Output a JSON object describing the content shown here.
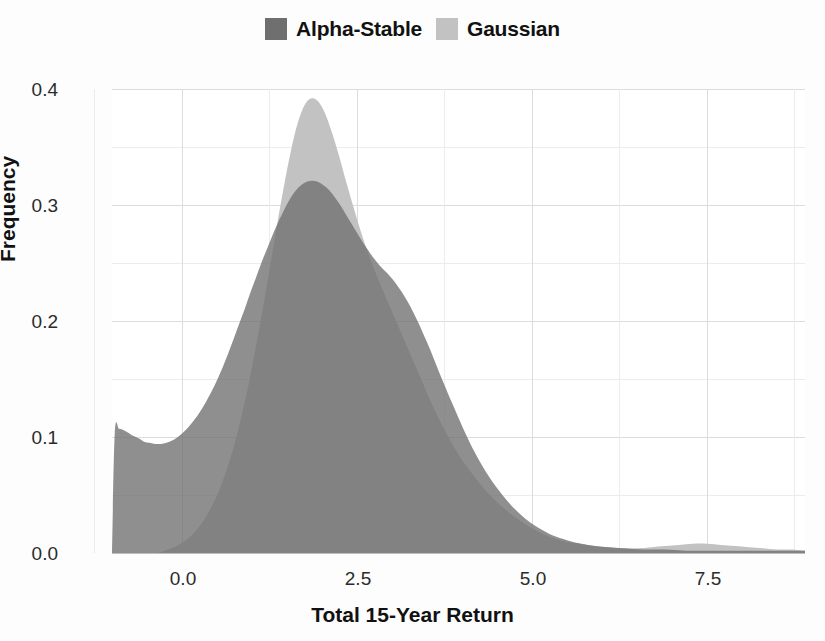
{
  "chart_data": {
    "type": "area",
    "title": "",
    "xlabel": "Total 15-Year Return",
    "ylabel": "Frequency",
    "xlim": [
      -1.0,
      8.9
    ],
    "ylim": [
      0.0,
      0.4
    ],
    "xticks": [
      "0.0",
      "2.5",
      "5.0",
      "7.5"
    ],
    "xtick_values": [
      0.0,
      2.5,
      5.0,
      7.5
    ],
    "yticks": [
      "0.0",
      "0.1",
      "0.2",
      "0.3",
      "0.4"
    ],
    "ytick_values": [
      0.0,
      0.1,
      0.2,
      0.3,
      0.4
    ],
    "grid": true,
    "grid_minor_x": [
      -1.25,
      1.25,
      3.75,
      6.25,
      8.75
    ],
    "grid_minor_y": [
      0.05,
      0.15,
      0.25,
      0.35
    ],
    "legend_position": "top-center",
    "colors": {
      "alpha_stable": "#6f6f6f",
      "gaussian": "#c2c2c2",
      "grid": "#dcdcdc",
      "axis_text": "#2b2b2b",
      "background": "#ffffff"
    },
    "series": [
      {
        "name": "Alpha-Stable",
        "color": "#6f6f6f",
        "x": [
          -1.0,
          -0.96,
          -0.9,
          -0.84,
          -0.78,
          -0.7,
          -0.62,
          -0.54,
          -0.46,
          -0.38,
          -0.3,
          -0.22,
          -0.14,
          -0.06,
          0.02,
          0.1,
          0.18,
          0.26,
          0.34,
          0.42,
          0.5,
          0.58,
          0.66,
          0.74,
          0.82,
          0.9,
          0.98,
          1.06,
          1.14,
          1.22,
          1.3,
          1.38,
          1.46,
          1.54,
          1.62,
          1.7,
          1.78,
          1.86,
          1.94,
          2.02,
          2.1,
          2.18,
          2.26,
          2.34,
          2.42,
          2.5,
          2.58,
          2.66,
          2.74,
          2.82,
          2.9,
          2.98,
          3.06,
          3.14,
          3.22,
          3.3,
          3.38,
          3.46,
          3.54,
          3.62,
          3.7,
          3.86,
          4.02,
          4.18,
          4.34,
          4.5,
          4.66,
          4.82,
          4.98,
          5.14,
          5.3,
          5.5,
          5.7,
          5.9,
          6.1,
          6.3,
          6.6,
          6.9,
          7.2,
          7.5,
          7.8,
          8.1,
          8.4,
          8.7,
          8.9
        ],
        "y": [
          0.0,
          0.104,
          0.107,
          0.106,
          0.104,
          0.101,
          0.099,
          0.096,
          0.095,
          0.094,
          0.094,
          0.095,
          0.097,
          0.1,
          0.104,
          0.109,
          0.115,
          0.122,
          0.13,
          0.139,
          0.149,
          0.16,
          0.172,
          0.185,
          0.198,
          0.211,
          0.225,
          0.238,
          0.251,
          0.263,
          0.275,
          0.286,
          0.296,
          0.305,
          0.312,
          0.317,
          0.32,
          0.321,
          0.32,
          0.317,
          0.313,
          0.307,
          0.3,
          0.292,
          0.284,
          0.276,
          0.268,
          0.261,
          0.254,
          0.248,
          0.243,
          0.238,
          0.232,
          0.225,
          0.217,
          0.208,
          0.198,
          0.187,
          0.176,
          0.164,
          0.152,
          0.129,
          0.107,
          0.087,
          0.07,
          0.056,
          0.044,
          0.034,
          0.026,
          0.02,
          0.015,
          0.011,
          0.008,
          0.006,
          0.005,
          0.004,
          0.003,
          0.003,
          0.002,
          0.002,
          0.002,
          0.002,
          0.002,
          0.002,
          0.002
        ]
      },
      {
        "name": "Gaussian",
        "color": "#c2c2c2",
        "x": [
          -0.35,
          -0.25,
          -0.15,
          -0.05,
          0.05,
          0.15,
          0.25,
          0.35,
          0.45,
          0.55,
          0.65,
          0.75,
          0.85,
          0.95,
          1.05,
          1.15,
          1.25,
          1.35,
          1.45,
          1.55,
          1.65,
          1.75,
          1.85,
          1.95,
          2.05,
          2.15,
          2.25,
          2.35,
          2.45,
          2.55,
          2.65,
          2.75,
          2.85,
          2.95,
          3.05,
          3.15,
          3.25,
          3.35,
          3.45,
          3.55,
          3.65,
          3.75,
          3.85,
          3.95,
          4.05,
          4.2,
          4.35,
          4.5,
          4.65,
          4.8,
          4.95,
          5.1,
          5.25,
          5.4,
          5.55,
          5.7,
          5.9,
          6.1,
          6.3,
          6.5,
          6.7,
          6.9,
          7.1,
          7.3,
          7.5,
          7.7,
          7.9,
          8.1,
          8.3,
          8.5,
          8.7,
          8.9
        ],
        "y": [
          0.0,
          0.002,
          0.004,
          0.007,
          0.011,
          0.016,
          0.023,
          0.032,
          0.043,
          0.057,
          0.074,
          0.094,
          0.118,
          0.145,
          0.176,
          0.209,
          0.244,
          0.28,
          0.314,
          0.345,
          0.37,
          0.386,
          0.392,
          0.389,
          0.378,
          0.361,
          0.341,
          0.319,
          0.298,
          0.278,
          0.26,
          0.244,
          0.229,
          0.215,
          0.201,
          0.187,
          0.173,
          0.159,
          0.145,
          0.131,
          0.118,
          0.106,
          0.095,
          0.085,
          0.076,
          0.064,
          0.053,
          0.044,
          0.036,
          0.029,
          0.023,
          0.018,
          0.014,
          0.011,
          0.009,
          0.008,
          0.006,
          0.005,
          0.004,
          0.004,
          0.005,
          0.006,
          0.007,
          0.008,
          0.008,
          0.007,
          0.006,
          0.005,
          0.004,
          0.003,
          0.003,
          0.002
        ]
      }
    ]
  },
  "legend": {
    "entries": [
      {
        "label": "Alpha-Stable",
        "color": "#6f6f6f"
      },
      {
        "label": "Gaussian",
        "color": "#c2c2c2"
      }
    ]
  },
  "axes": {
    "y_title": "Frequency",
    "x_title": "Total 15-Year Return",
    "y_tick_labels": [
      "0.4",
      "0.3",
      "0.2",
      "0.1",
      "0.0"
    ],
    "x_tick_labels": [
      "0.0",
      "2.5",
      "5.0",
      "7.5"
    ]
  }
}
